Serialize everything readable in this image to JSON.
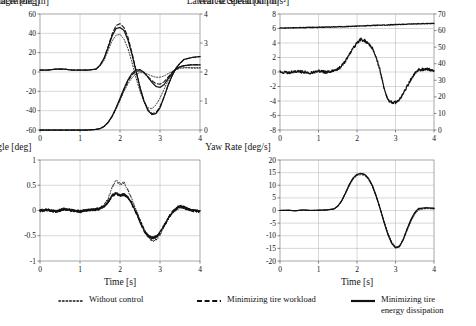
{
  "figure": {
    "xlabel": "Time [s]",
    "series_styles": [
      "dotted",
      "dashed",
      "solid"
    ]
  },
  "legend": {
    "items": [
      {
        "label": "Without control",
        "style": "dotted",
        "sample": "······"
      },
      {
        "label": "Minimizing tire workload",
        "style": "dashed",
        "sample": "– – –"
      },
      {
        "label": "Minimizing tire\nenergy dissipation",
        "style": "solid",
        "sample": "—"
      }
    ]
  },
  "chart_data": [
    {
      "type": "line",
      "panel": "top-left",
      "title": "",
      "xlabel": "Time [s]",
      "ylabel": "Steering Angle [deg]",
      "y2label": "Lateral Displacement [m]",
      "xlim": [
        0,
        4
      ],
      "xticks": [
        0,
        1,
        2,
        3,
        4
      ],
      "ylim": [
        -60,
        60
      ],
      "yticks": [
        -60,
        -40,
        -20,
        0,
        20,
        40,
        60
      ],
      "y2lim": [
        0,
        4
      ],
      "y2ticks": [
        0,
        1,
        2,
        3,
        4
      ],
      "grid": true,
      "legend": "below figure",
      "x": [
        0,
        0.2,
        0.4,
        0.6,
        0.8,
        1.0,
        1.2,
        1.4,
        1.5,
        1.6,
        1.7,
        1.8,
        1.9,
        2.0,
        2.1,
        2.2,
        2.3,
        2.4,
        2.5,
        2.6,
        2.7,
        2.8,
        2.9,
        3.0,
        3.1,
        3.2,
        3.3,
        3.4,
        3.5,
        3.6,
        3.8,
        4.0
      ],
      "series": [
        {
          "name": "Without control",
          "axis": "left",
          "style": "dotted",
          "values": [
            2,
            2,
            3,
            3,
            2,
            2,
            2,
            3,
            6,
            12,
            22,
            32,
            38,
            39,
            34,
            24,
            10,
            -6,
            -20,
            -31,
            -37,
            -38,
            -34,
            -27,
            -18,
            -9,
            -2,
            3,
            5,
            5,
            4,
            4
          ]
        },
        {
          "name": "Minimizing tire workload",
          "axis": "left",
          "style": "dashed",
          "values": [
            2,
            2,
            3,
            3,
            2,
            2,
            2,
            3,
            7,
            14,
            26,
            39,
            48,
            50,
            46,
            36,
            20,
            2,
            -16,
            -30,
            -39,
            -43,
            -42,
            -36,
            -26,
            -14,
            -4,
            4,
            9,
            13,
            15,
            16
          ]
        },
        {
          "name": "Minimizing tire energy dissipation",
          "axis": "left",
          "style": "solid",
          "values": [
            2,
            2,
            3,
            3,
            2,
            2,
            2,
            3,
            7,
            14,
            25,
            37,
            45,
            46,
            43,
            33,
            18,
            1,
            -16,
            -30,
            -40,
            -44,
            -43,
            -37,
            -26,
            -14,
            -4,
            4,
            9,
            13,
            15,
            16
          ]
        },
        {
          "name": "Without control",
          "axis": "right",
          "style": "dotted",
          "values": [
            0,
            0,
            0,
            0,
            0,
            0,
            0,
            0.02,
            0.05,
            0.12,
            0.25,
            0.45,
            0.72,
            1.02,
            1.33,
            1.6,
            1.8,
            1.93,
            1.98,
            1.97,
            1.92,
            1.86,
            1.82,
            1.82,
            1.86,
            1.94,
            2.02,
            2.08,
            2.12,
            2.14,
            2.15,
            2.15
          ]
        },
        {
          "name": "Minimizing tire workload",
          "axis": "right",
          "style": "dashed",
          "values": [
            0,
            0,
            0,
            0,
            0,
            0,
            0,
            0.02,
            0.05,
            0.12,
            0.25,
            0.46,
            0.74,
            1.06,
            1.39,
            1.68,
            1.9,
            2.02,
            2.04,
            1.97,
            1.84,
            1.7,
            1.6,
            1.58,
            1.66,
            1.82,
            1.98,
            2.1,
            2.18,
            2.22,
            2.25,
            2.25
          ]
        },
        {
          "name": "Minimizing tire energy dissipation",
          "axis": "right",
          "style": "solid",
          "values": [
            0,
            0,
            0,
            0,
            0,
            0,
            0,
            0.02,
            0.05,
            0.12,
            0.26,
            0.47,
            0.76,
            1.09,
            1.43,
            1.73,
            1.95,
            2.07,
            2.08,
            1.99,
            1.82,
            1.64,
            1.5,
            1.47,
            1.56,
            1.76,
            1.96,
            2.1,
            2.18,
            2.22,
            2.25,
            2.25
          ]
        }
      ]
    },
    {
      "type": "line",
      "panel": "top-right",
      "title": "",
      "xlabel": "Time [s]",
      "ylabel": "Lateral Acceleration [m/s²]",
      "y2label": "Vehicle Speed [km/h]",
      "xlim": [
        0,
        4
      ],
      "xticks": [
        0,
        1,
        2,
        3,
        4
      ],
      "ylim": [
        -8,
        8
      ],
      "yticks": [
        -8,
        -6,
        -4,
        -2,
        0,
        2,
        4,
        6,
        8
      ],
      "y2lim": [
        0,
        70
      ],
      "y2ticks": [
        0,
        10,
        20,
        30,
        40,
        50,
        60,
        70
      ],
      "grid": true,
      "noise": "measured signal with high-frequency noise",
      "x": [
        0,
        0.2,
        0.4,
        0.6,
        0.8,
        1.0,
        1.2,
        1.4,
        1.5,
        1.6,
        1.7,
        1.8,
        1.9,
        2.0,
        2.1,
        2.2,
        2.3,
        2.4,
        2.5,
        2.6,
        2.7,
        2.8,
        2.9,
        3.0,
        3.1,
        3.2,
        3.3,
        3.4,
        3.5,
        3.6,
        3.8,
        4.0
      ],
      "series": [
        {
          "name": "Lateral acceleration (all controllers)",
          "axis": "left",
          "style": "solid",
          "values": [
            0,
            -0.1,
            0.1,
            0,
            -0.1,
            0.1,
            0,
            0.2,
            0.4,
            0.8,
            1.5,
            2.4,
            3.3,
            4.0,
            4.5,
            4.3,
            3.9,
            3.3,
            2.0,
            0.2,
            -2.2,
            -3.8,
            -4.2,
            -4.2,
            -3.8,
            -3.0,
            -2.0,
            -1.0,
            -0.2,
            0.3,
            0.4,
            0.2
          ]
        },
        {
          "name": "Vehicle speed (all controllers)",
          "axis": "right",
          "style": "solid",
          "values": [
            61.5,
            61.6,
            61.7,
            61.8,
            61.9,
            62.0,
            62.1,
            62.2,
            62.3,
            62.3,
            62.4,
            62.5,
            62.6,
            62.7,
            62.8,
            62.9,
            63.0,
            63.1,
            63.2,
            63.2,
            63.3,
            63.4,
            63.5,
            63.6,
            63.7,
            63.8,
            63.9,
            64.0,
            64.0,
            64.1,
            64.2,
            64.3
          ]
        }
      ]
    },
    {
      "type": "line",
      "panel": "bottom-left",
      "title": "",
      "xlabel": "Time [s]",
      "ylabel": "Slip Angle [deg]",
      "xlim": [
        0,
        4
      ],
      "xticks": [
        0,
        1,
        2,
        3,
        4
      ],
      "ylim": [
        -1,
        1
      ],
      "yticks": [
        -1,
        -0.5,
        0,
        0.5,
        1
      ],
      "grid": true,
      "noise": "measured signal with high-frequency noise",
      "x": [
        0,
        0.2,
        0.4,
        0.6,
        0.8,
        1.0,
        1.2,
        1.4,
        1.5,
        1.6,
        1.7,
        1.8,
        1.9,
        2.0,
        2.1,
        2.2,
        2.3,
        2.4,
        2.5,
        2.6,
        2.7,
        2.8,
        2.9,
        3.0,
        3.1,
        3.2,
        3.3,
        3.4,
        3.5,
        3.6,
        3.8,
        4.0
      ],
      "series": [
        {
          "name": "Without control",
          "style": "dotted",
          "values": [
            0,
            0.01,
            -0.02,
            0.03,
            0,
            -0.02,
            0.01,
            0.02,
            0.05,
            0.1,
            0.22,
            0.45,
            0.6,
            0.52,
            0.55,
            0.4,
            0.22,
            0.02,
            -0.18,
            -0.38,
            -0.52,
            -0.6,
            -0.58,
            -0.48,
            -0.32,
            -0.18,
            -0.06,
            0.02,
            0.06,
            0.04,
            0,
            -0.02
          ]
        },
        {
          "name": "Minimizing tire workload",
          "style": "dashed",
          "values": [
            0,
            0.01,
            -0.02,
            0.03,
            0,
            -0.02,
            0.01,
            0.02,
            0.04,
            0.08,
            0.16,
            0.28,
            0.34,
            0.3,
            0.33,
            0.26,
            0.14,
            -0.02,
            -0.2,
            -0.38,
            -0.5,
            -0.54,
            -0.52,
            -0.44,
            -0.3,
            -0.16,
            -0.04,
            0.04,
            0.08,
            0.05,
            0,
            -0.02
          ]
        },
        {
          "name": "Minimizing tire energy dissipation",
          "style": "solid",
          "values": [
            0,
            0.01,
            -0.02,
            0.03,
            0,
            -0.02,
            0.01,
            0.02,
            0.04,
            0.08,
            0.16,
            0.29,
            0.35,
            0.29,
            0.32,
            0.25,
            0.12,
            -0.04,
            -0.22,
            -0.4,
            -0.5,
            -0.54,
            -0.52,
            -0.44,
            -0.3,
            -0.16,
            -0.04,
            0.04,
            0.09,
            0.06,
            0,
            -0.02
          ]
        }
      ]
    },
    {
      "type": "line",
      "panel": "bottom-right",
      "title": "",
      "xlabel": "Time [s]",
      "ylabel": "Yaw Rate [deg/s]",
      "xlim": [
        0,
        4
      ],
      "xticks": [
        0,
        1,
        2,
        3,
        4
      ],
      "ylim": [
        -20,
        20
      ],
      "yticks": [
        -20,
        -15,
        -10,
        -5,
        0,
        5,
        10,
        15,
        20
      ],
      "grid": true,
      "x": [
        0,
        0.2,
        0.4,
        0.6,
        0.8,
        1.0,
        1.2,
        1.4,
        1.5,
        1.6,
        1.7,
        1.8,
        1.9,
        2.0,
        2.1,
        2.2,
        2.3,
        2.4,
        2.5,
        2.6,
        2.7,
        2.8,
        2.9,
        3.0,
        3.1,
        3.2,
        3.3,
        3.4,
        3.5,
        3.6,
        3.8,
        4.0
      ],
      "series": [
        {
          "name": "Without control",
          "style": "dotted",
          "values": [
            0,
            0.1,
            -0.1,
            0.2,
            0,
            0.1,
            0.2,
            0.6,
            1.6,
            3.6,
            6.6,
            9.8,
            12.4,
            13.8,
            14.2,
            13.8,
            12.2,
            9.4,
            5.4,
            0.8,
            -4.2,
            -8.8,
            -12.4,
            -14.4,
            -14.0,
            -11.6,
            -8.0,
            -4.4,
            -1.6,
            0.2,
            0.8,
            0.6
          ]
        },
        {
          "name": "Minimizing tire workload",
          "style": "dashed",
          "values": [
            0,
            0.1,
            -0.1,
            0.2,
            0,
            0.1,
            0.2,
            0.6,
            1.7,
            3.8,
            6.9,
            10.2,
            12.8,
            14.2,
            14.6,
            14.2,
            12.6,
            9.8,
            5.6,
            0.8,
            -4.4,
            -9.2,
            -12.8,
            -14.6,
            -14.2,
            -11.4,
            -7.4,
            -3.8,
            -1.0,
            0.6,
            1.0,
            0.8
          ]
        },
        {
          "name": "Minimizing tire energy dissipation",
          "style": "solid",
          "values": [
            0,
            0.1,
            -0.1,
            0.2,
            0,
            0.1,
            0.2,
            0.6,
            1.7,
            3.8,
            6.9,
            10.3,
            12.9,
            14.3,
            14.7,
            14.3,
            12.7,
            9.9,
            5.7,
            0.8,
            -4.5,
            -9.4,
            -13.0,
            -14.8,
            -14.4,
            -11.6,
            -7.4,
            -3.6,
            -0.8,
            0.8,
            1.1,
            0.9
          ]
        }
      ]
    }
  ]
}
